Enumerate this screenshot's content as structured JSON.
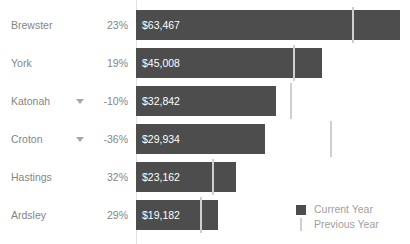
{
  "chart_data": {
    "type": "bar",
    "title": "",
    "xlabel": "",
    "ylabel": "",
    "orientation": "horizontal",
    "grid": false,
    "axis_origin_x": 136,
    "legend_position": "bottom-right",
    "categories": [
      "Brewster",
      "York",
      "Katonah",
      "Croton",
      "Hastings",
      "Ardsley"
    ],
    "series": [
      {
        "name": "Current Year",
        "color": "#4d4d4d",
        "values": [
          63467,
          45008,
          32842,
          29934,
          23162,
          19182
        ],
        "value_labels": [
          "$63,467",
          "$45,008",
          "$32,842",
          "$29,934",
          "$23,162",
          "$19,182"
        ]
      },
      {
        "name": "Previous Year",
        "color": "#cfcfcf",
        "marker": "vertical-line",
        "values": [
          51599,
          37822,
          36491,
          46772,
          17547,
          14870
        ]
      }
    ],
    "percent_change": {
      "labels": [
        "23%",
        "19%",
        "-10%",
        "-36%",
        "32%",
        "29%"
      ],
      "values": [
        23,
        19,
        -10,
        -36,
        32,
        29
      ],
      "negative_flags": [
        false,
        false,
        true,
        true,
        false,
        false
      ]
    },
    "bar_pixel_widths": [
      264,
      186,
      140,
      129,
      100,
      82
    ],
    "marker_pixel_offsets": [
      216,
      157,
      154,
      194,
      76,
      64
    ],
    "row_tops": [
      10,
      48,
      86,
      124,
      162,
      200
    ]
  },
  "legend": {
    "items": [
      {
        "label": "Current Year",
        "marker": "square-swatch"
      },
      {
        "label": "Previous Year",
        "marker": "line-swatch"
      }
    ]
  },
  "colors": {
    "bar": "#4d4d4d",
    "marker": "#cfcfcf",
    "axis": "#e2e2e2",
    "label_text": "#858585",
    "value_text": "#ffffff",
    "legend_text": "#a0a0a0",
    "background": "#ffffff"
  }
}
